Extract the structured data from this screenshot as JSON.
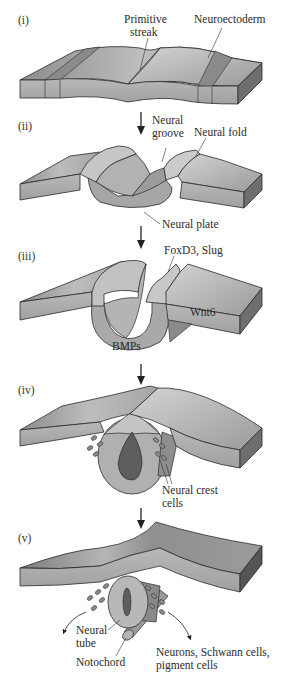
{
  "figure": {
    "type": "diagram",
    "colors": {
      "tissue_light": "#c8c8c8",
      "tissue_mid": "#a9a9a9",
      "tissue_dark": "#7a7a7a",
      "band_dark": "#8a8a8a",
      "lumen_dark": "#5e5e5e",
      "outline": "#2b2b2b"
    },
    "stages": [
      {
        "numeral": "(i)",
        "labels": {
          "primitive_streak_1": "Primitive",
          "primitive_streak_2": "streak",
          "neuroectoderm": "Neuroectoderm"
        }
      },
      {
        "numeral": "(ii)",
        "labels": {
          "neural_groove_1": "Neural",
          "neural_groove_2": "groove",
          "neural_fold": "Neural fold",
          "neural_plate": "Neural plate"
        }
      },
      {
        "numeral": "(iii)",
        "labels": {
          "foxd3_slug": "FoxD3, Slug",
          "wnt6": "Wnt6",
          "bmps": "BMPs"
        }
      },
      {
        "numeral": "(iv)",
        "labels": {
          "neural_crest_1": "Neural crest",
          "neural_crest_2": "cells"
        }
      },
      {
        "numeral": "(v)",
        "labels": {
          "neural_tube_1": "Neural",
          "neural_tube_2": "tube",
          "notochord": "Notochord",
          "derivatives_1": "Neurons, Schwann cells,",
          "derivatives_2": "pigment cells"
        }
      }
    ],
    "arrows": [
      "down-arrow-1",
      "down-arrow-2",
      "down-arrow-3",
      "down-arrow-4"
    ]
  }
}
